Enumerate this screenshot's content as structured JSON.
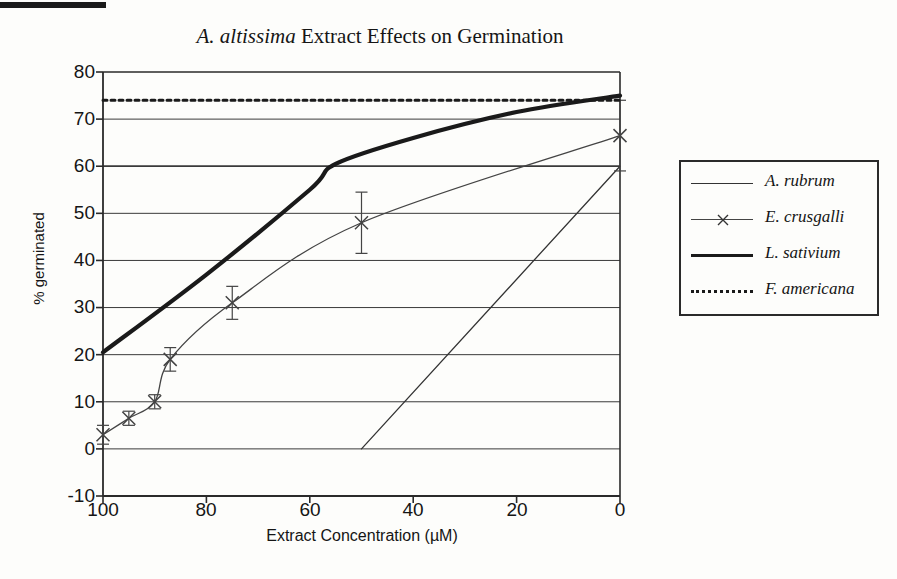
{
  "figure": {
    "scan_artifact": "black-scan-bar",
    "background_color": "#fdfdfb"
  },
  "chart_data": {
    "type": "line",
    "title": "A. altissima Extract Effects on Germination",
    "title_italic_part": "A. altissima",
    "title_rest": " Extract Effects on Germination",
    "xlabel": "Extract Concentration (µM)",
    "ylabel": "% germinated",
    "xlim": [
      100,
      0
    ],
    "ylim": [
      -10,
      80
    ],
    "x_reversed": true,
    "xticks": [
      100,
      80,
      60,
      40,
      20,
      0
    ],
    "yticks": [
      -10,
      0,
      10,
      20,
      30,
      40,
      50,
      60,
      70,
      80
    ],
    "grid": "horizontal",
    "legend_position": "right-outside",
    "series": [
      {
        "name": "A. rubrum",
        "style": "thin-solid",
        "color": "#333333",
        "x": [
          50,
          0
        ],
        "values": [
          0,
          60
        ],
        "marker": "none"
      },
      {
        "name": "E. crusgalli",
        "style": "thin-solid-with-markers",
        "color": "#444444",
        "marker": "x",
        "x": [
          100,
          95,
          90,
          87,
          75,
          50,
          0
        ],
        "values": [
          3,
          6.5,
          10,
          19,
          31,
          48,
          66.5
        ],
        "errors": [
          2,
          1.5,
          1.5,
          2.5,
          3.5,
          6.5,
          7.5
        ]
      },
      {
        "name": "L. sativium",
        "style": "thick-solid",
        "color": "#1a1a1a",
        "x": [
          100,
          80,
          60,
          55,
          40,
          20,
          0
        ],
        "values": [
          20.5,
          37,
          55,
          60.5,
          66,
          71.5,
          75
        ],
        "marker": "none"
      },
      {
        "name": "F. americana",
        "style": "dotted",
        "color": "#1a1a1a",
        "x": [
          100,
          0
        ],
        "values": [
          74,
          74
        ],
        "marker": "none"
      }
    ]
  },
  "legend": {
    "items": [
      {
        "label": "A. rubrum",
        "key": "thin-line-key"
      },
      {
        "label": "E. crusgalli",
        "key": "x-marker-line-key"
      },
      {
        "label": "L. sativium",
        "key": "thick-line-key"
      },
      {
        "label": "F. americana",
        "key": "dotted-line-key"
      }
    ]
  }
}
